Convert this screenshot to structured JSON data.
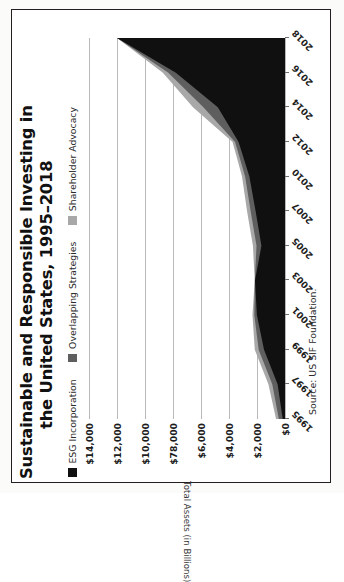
{
  "figure": {
    "title_line1": "Sustainable and Responsible Investing in",
    "title_line2": "the United States, 1995–2018",
    "source": "Source: US SIF Foundation."
  },
  "legend": {
    "items": [
      {
        "label": "ESG Incorporation",
        "color": "#101010"
      },
      {
        "label": "Overlapping Strategies",
        "color": "#5e5e5e"
      },
      {
        "label": "Shareholder Advocacy",
        "color": "#a8a8a8"
      }
    ]
  },
  "chart_data": {
    "type": "area",
    "title": "Sustainable and Responsible Investing in the United States, 1995–2018",
    "xlabel": "",
    "ylabel": "Total Assets (in Billions)",
    "ylim": [
      0,
      14000
    ],
    "grid": true,
    "legend_position": "top-left",
    "stacked": true,
    "categories": [
      "1995",
      "1997",
      "1999",
      "2001",
      "2003",
      "2005",
      "2007",
      "2010",
      "2012",
      "2014",
      "2016",
      "2018"
    ],
    "ytick_labels": [
      "$14,000",
      "$12,000",
      "$10,000",
      "$78,000",
      "$6,000",
      "$4,000",
      "$2,000",
      "$0"
    ],
    "ytick_values": [
      14000,
      12000,
      10000,
      8000,
      6000,
      4000,
      2000,
      0
    ],
    "series": [
      {
        "name": "ESG Incorporation",
        "color": "#101010",
        "values": [
          162,
          529,
          1497,
          2010,
          2143,
          1685,
          2098,
          2545,
          3314,
          4800,
          7797,
          11995
        ]
      },
      {
        "name": "Overlapping Strategies",
        "color": "#5e5e5e",
        "values": [
          -84,
          -84,
          -265,
          -592,
          -441,
          -117,
          -151,
          -981,
          -1012,
          -1180,
          -1460,
          -1160
        ]
      },
      {
        "name": "Shareholder Advocacy",
        "color": "#a8a8a8",
        "values": [
          473,
          736,
          922,
          897,
          448,
          703,
          739,
          1497,
          1536,
          1722,
          1816,
          1800
        ]
      },
      {
        "name": "Total",
        "color": "#a8a8a8",
        "values": [
          639,
          1185,
          2159,
          2323,
          2164,
          2290,
          2711,
          3069,
          3744,
          6572,
          8723,
          11995
        ]
      }
    ]
  }
}
